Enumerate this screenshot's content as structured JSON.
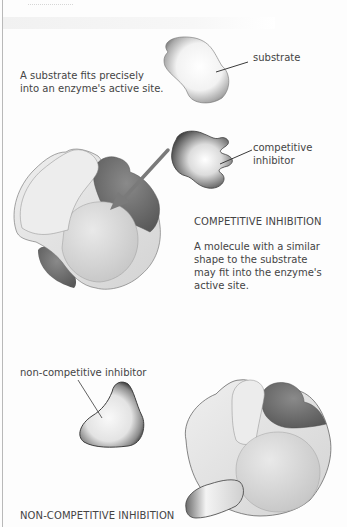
{
  "diagram": {
    "section_substrate": {
      "caption_lines": [
        "A substrate fits precisely",
        "into an enzyme's active site."
      ],
      "label": "substrate"
    },
    "section_competitive": {
      "label_lines": [
        "competitive",
        "inhibitor"
      ],
      "heading": "COMPETITIVE INHIBITION",
      "description_lines": [
        "A molecule with a similar",
        "shape to the substrate",
        "may fit into the enzyme's",
        "active site."
      ]
    },
    "section_noncompetitive": {
      "label": "non-competitive inhibitor",
      "heading": "NON-COMPETITIVE INHIBITION"
    },
    "colors": {
      "enzyme_light": "#e4e4e4",
      "enzyme_mid": "#cfcfcf",
      "active_site_dark": "#6e6e6e",
      "outline": "#4a4a4a",
      "arrow": "#7a7a7a",
      "text": "#444444",
      "page_rule": "#b9b9b9"
    }
  }
}
